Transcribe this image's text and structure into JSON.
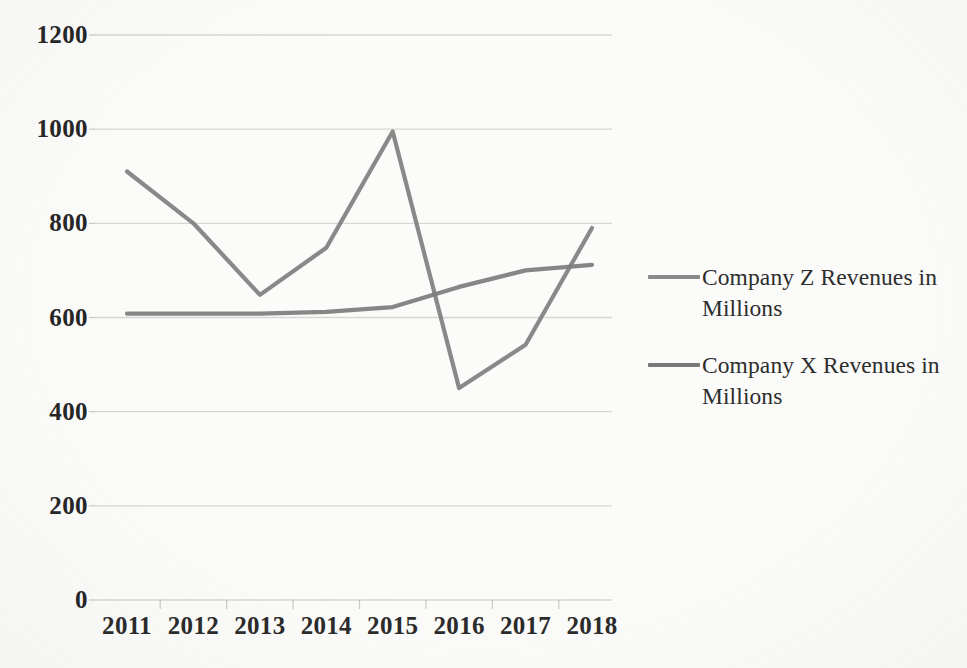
{
  "chart_data": {
    "type": "line",
    "title": "",
    "xlabel": "",
    "ylabel": "",
    "categories": [
      "2011",
      "2012",
      "2013",
      "2014",
      "2015",
      "2016",
      "2017",
      "2018"
    ],
    "ylim": [
      0,
      1200
    ],
    "ytick_values": [
      0,
      200,
      400,
      600,
      800,
      1000,
      1200
    ],
    "ytick_labels": [
      "0",
      "200",
      "400",
      "600",
      "800",
      "1000",
      "1200"
    ],
    "grid": true,
    "grid_axis": "y",
    "legend_position": "right",
    "series": [
      {
        "name": "Company Z Revenues in Millions",
        "color": "#808080",
        "values": [
          910,
          800,
          648,
          748,
          995,
          450,
          542,
          790
        ]
      },
      {
        "name": "Company X Revenues in Millions",
        "color": "#7d7d7d",
        "values": [
          608,
          608,
          608,
          612,
          622,
          665,
          700,
          712
        ]
      }
    ]
  },
  "legend": {
    "entries": [
      {
        "label": "Company Z Revenues in Millions",
        "swatch_color": "#8a8a8a"
      },
      {
        "label": "Company X Revenues in Millions",
        "swatch_color": "#787878"
      }
    ]
  },
  "axes": {
    "axis_line_color": "#b9b9b4",
    "grid_line_color": "#cfcfca",
    "tick_label_color": "#2b2b2b"
  }
}
